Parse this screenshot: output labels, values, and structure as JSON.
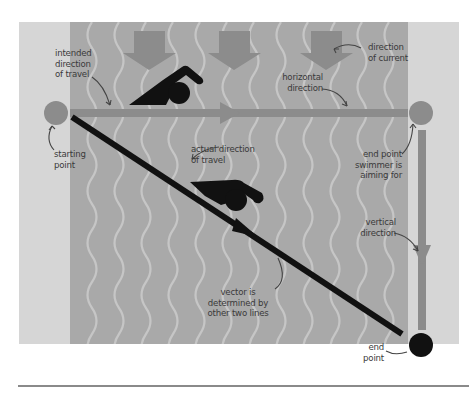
{
  "diagram": {
    "type": "vector-diagram",
    "colors": {
      "bank": "#d6d6d6",
      "water": "#a9a9a9",
      "waves": "#c9c9c9",
      "current_arrow": "#8c8c8c",
      "horizontal_vector": "#8c8c8c",
      "vertical_vector": "#8c8c8c",
      "resultant_vector": "#111111",
      "start_point": "#8c8c8c",
      "aim_point": "#8c8c8c",
      "end_point": "#111111",
      "swimmer": "#111111",
      "divider": "#8a8a8a"
    },
    "labels": {
      "intended": [
        "intended",
        "direction",
        "of travel"
      ],
      "current": [
        "direction",
        "of current"
      ],
      "horizontal": [
        "horizontal",
        "direction"
      ],
      "starting": [
        "starting",
        "point"
      ],
      "actual": [
        "actual direction",
        "of travel"
      ],
      "aim": [
        "end point",
        "swimmer is",
        "aiming for"
      ],
      "vertical": [
        "vertical",
        "direction"
      ],
      "vector": [
        "vector is",
        "determined by",
        "other two lines"
      ],
      "end": [
        "end",
        "point"
      ]
    },
    "current_arrow_count": 3
  }
}
